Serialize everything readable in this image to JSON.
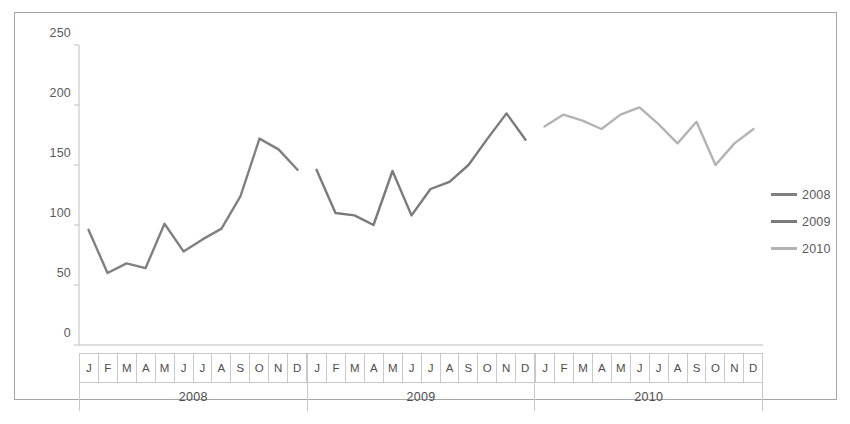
{
  "chart_data": {
    "type": "line",
    "title": "",
    "xlabel": "",
    "ylabel": "",
    "ylim": [
      0,
      250
    ],
    "y_ticks": [
      0,
      50,
      100,
      150,
      200,
      250
    ],
    "grid": false,
    "legend_position": "right",
    "categories": [
      "J",
      "F",
      "M",
      "A",
      "M",
      "J",
      "J",
      "A",
      "S",
      "O",
      "N",
      "D"
    ],
    "category_names": [
      "January",
      "February",
      "March",
      "April",
      "May",
      "June",
      "July",
      "August",
      "September",
      "October",
      "November",
      "December"
    ],
    "groups": [
      "2008",
      "2009",
      "2010"
    ],
    "series": [
      {
        "name": "2008",
        "color": "#808080",
        "group": "2008",
        "values": [
          96,
          60,
          68,
          64,
          101,
          78,
          88,
          97,
          124,
          172,
          163,
          146
        ]
      },
      {
        "name": "2009",
        "color": "#7a7a7a",
        "group": "2009",
        "values": [
          146,
          110,
          108,
          100,
          145,
          108,
          130,
          136,
          150,
          172,
          193,
          171
        ]
      },
      {
        "name": "2010",
        "color": "#b3b3b3",
        "group": "2010",
        "values": [
          182,
          192,
          187,
          180,
          192,
          198,
          184,
          168,
          186,
          150,
          168,
          180
        ]
      }
    ]
  },
  "axis": {
    "y_tick_labels": [
      "250",
      "200",
      "150",
      "100",
      "50",
      "0"
    ]
  },
  "legend": {
    "entries": [
      {
        "label": "2008",
        "color": "#808080"
      },
      {
        "label": "2009",
        "color": "#7a7a7a"
      },
      {
        "label": "2010",
        "color": "#b3b3b3"
      }
    ]
  },
  "colors": {
    "frame_border": "#a6a6a6",
    "axis_line": "#bfbfbf",
    "table_border": "#c9c9c9",
    "text": "#5a5a5a"
  }
}
